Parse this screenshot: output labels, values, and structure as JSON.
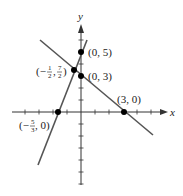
{
  "chart_data": {
    "type": "line",
    "title": "",
    "xlabel": "x",
    "ylabel": "y",
    "grid": false,
    "xlim": [
      -5,
      7.5
    ],
    "ylim": [
      -6,
      7.5
    ],
    "series": [
      {
        "name": "line through (0,5) and (-5/3,0)",
        "equation": "y = 3x + 5",
        "x": [
          -2.7,
          0.4
        ],
        "y": [
          -3.1,
          6.2
        ]
      },
      {
        "name": "line through (0,3) and (3,0)",
        "equation": "y = -x + 3",
        "x": [
          -3.1,
          5.9
        ],
        "y": [
          6.1,
          -2.9
        ]
      }
    ],
    "points": [
      {
        "x": 0,
        "y": 5,
        "label": "(0, 5)"
      },
      {
        "x": 0,
        "y": 3,
        "label": "(0, 3)"
      },
      {
        "x": 3,
        "y": 0,
        "label": "(3, 0)"
      },
      {
        "x": -1.6667,
        "y": 0,
        "label": "(-5/3, 0)"
      },
      {
        "x": -0.5,
        "y": 3.5,
        "label": "(-1/2, 7/2)"
      }
    ]
  },
  "labels": {
    "x_axis": "x",
    "y_axis": "y",
    "p05": "(0, 5)",
    "p03": "(0, 3)",
    "p30": "(3, 0)",
    "p53": {
      "open": "(−",
      "num": "5",
      "den": "3",
      "close": ", 0)"
    },
    "p12": {
      "open": "(−",
      "num1": "1",
      "den1": "2",
      "comma": ",",
      "num2": "7",
      "den2": "2",
      "close": ")"
    }
  },
  "colors": {
    "axis": "#333333",
    "line": "#555555",
    "point": "#000000"
  }
}
